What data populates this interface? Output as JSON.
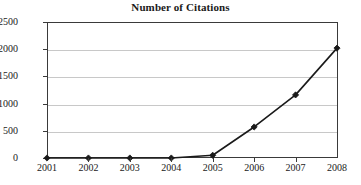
{
  "chart_data": {
    "type": "line",
    "title": "Number of Citations",
    "xlabel": "",
    "ylabel": "",
    "categories": [
      "2001",
      "2002",
      "2003",
      "2004",
      "2005",
      "2006",
      "2007",
      "2008"
    ],
    "values": [
      0,
      0,
      0,
      0,
      50,
      570,
      1160,
      2020
    ],
    "series": [
      {
        "name": "Number of Citations",
        "values": [
          0,
          0,
          0,
          0,
          50,
          570,
          1160,
          2020
        ]
      }
    ],
    "ylim": [
      0,
      2500
    ],
    "ytick_labels": [
      "0",
      "500",
      "1000",
      "1500",
      "2000",
      "2500"
    ],
    "ytick_values": [
      0,
      500,
      1000,
      1500,
      2000,
      2500
    ],
    "grid": "horizontal",
    "legend": "none",
    "marker": "diamond",
    "line_color": "#1a1a1a",
    "marker_color": "#1a1a1a",
    "grid_color": "#c8c8c8",
    "axis_color": "#3a3a3a",
    "background_color": "#ffffff"
  }
}
